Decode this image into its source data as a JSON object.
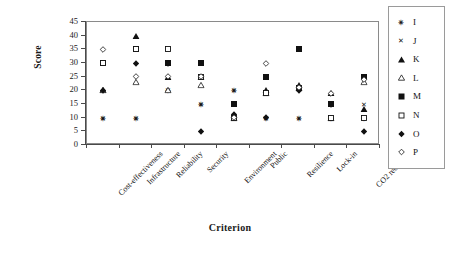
{
  "chart_data": {
    "type": "scatter",
    "title": "",
    "xlabel": "Criterion",
    "ylabel": "Score",
    "ylim": [
      0,
      45
    ],
    "yticks": [
      0,
      5,
      10,
      15,
      20,
      25,
      30,
      35,
      40,
      45
    ],
    "grid": false,
    "legend_position": "right",
    "categories": [
      "Cost-effectiveness",
      "Infrastructure",
      "Reliability",
      "Security",
      "Environment",
      "Public",
      "Resilience",
      "Lock-in",
      "CO2 reduction"
    ],
    "series": [
      {
        "name": "I",
        "marker": "asterisk-filled",
        "values": [
          10,
          10,
          20,
          15,
          20,
          10,
          10,
          10,
          10
        ]
      },
      {
        "name": "J",
        "marker": "cross-x",
        "values": [
          10,
          10,
          20,
          15,
          20,
          10,
          10,
          10,
          15
        ]
      },
      {
        "name": "K",
        "marker": "triangle-filled",
        "values": [
          20,
          40,
          25,
          25,
          11,
          20,
          22,
          19,
          13
        ]
      },
      {
        "name": "L",
        "marker": "triangle-open",
        "values": [
          20,
          23,
          20,
          22,
          10,
          19,
          21,
          10,
          23
        ]
      },
      {
        "name": "M",
        "marker": "square-filled",
        "values": [
          30,
          35,
          30,
          30,
          15,
          25,
          35,
          15,
          25
        ]
      },
      {
        "name": "N",
        "marker": "square-open",
        "values": [
          30,
          35,
          35,
          25,
          10,
          19,
          21,
          10,
          10
        ]
      },
      {
        "name": "O",
        "marker": "diamond-filled",
        "values": [
          20,
          30,
          30,
          5,
          11,
          10,
          20,
          15,
          5
        ]
      },
      {
        "name": "P",
        "marker": "diamond-open",
        "values": [
          35,
          25,
          25,
          25,
          10,
          30,
          21,
          19,
          24
        ]
      }
    ]
  },
  "legend": {
    "entries": [
      {
        "label": "I",
        "marker": "asterisk-filled"
      },
      {
        "label": "J",
        "marker": "cross-x"
      },
      {
        "label": "K",
        "marker": "triangle-filled"
      },
      {
        "label": "L",
        "marker": "triangle-open"
      },
      {
        "label": "M",
        "marker": "square-filled"
      },
      {
        "label": "N",
        "marker": "square-open"
      },
      {
        "label": "O",
        "marker": "diamond-filled"
      },
      {
        "label": "P",
        "marker": "diamond-open"
      }
    ]
  },
  "axes": {
    "y_title": "Score",
    "x_title": "Criterion"
  },
  "colors": {
    "marker": "#111111",
    "frame": "#8a8a8a",
    "axis": "#4a4a4a",
    "background": "#ffffff"
  }
}
